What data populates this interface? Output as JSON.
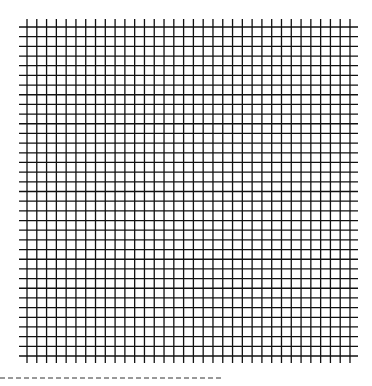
{
  "diagram": {
    "type": "square-grid",
    "line_color": "#111111",
    "background": "#ffffff",
    "vertical_lines": {
      "count": 34,
      "x_start": 27,
      "x_end": 350,
      "y_top": 19,
      "y_bottom": 363
    },
    "horizontal_lines": {
      "count": 35,
      "y_start": 27,
      "y_end": 356,
      "x_left": 19,
      "x_right": 358
    },
    "line_width": 1.3
  },
  "dashed_line": {
    "y": 378,
    "x_start": 0,
    "x_end": 223,
    "dash": 5,
    "gap": 3,
    "color": "#333333"
  }
}
